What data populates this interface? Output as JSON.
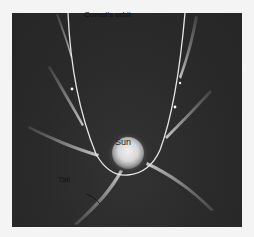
{
  "diagram": {
    "title": "Comet's orbit",
    "labels": {
      "orbit": "Comet's orbit",
      "sun": "Sun",
      "tail": "Tail"
    },
    "colors": {
      "background": "#2b2b2b",
      "orbit_line": "#e6e6e6",
      "tail": "#bdbdbd",
      "sun_core": "#e8e8e8",
      "sun_halo": "#8a8a8a",
      "label_text": "#121212",
      "page": "#f4f4f4"
    },
    "nodes": [
      {
        "id": "sun",
        "label": "Sun",
        "x": 128,
        "y": 153,
        "radius": 16
      },
      {
        "id": "orbit",
        "label": "Comet's orbit",
        "shape": "parabola opening upward around the Sun"
      },
      {
        "id": "tail",
        "label": "Tail",
        "note": "comet tails always point away from the Sun"
      }
    ],
    "comet_positions": [
      {
        "side": "left",
        "x": 70,
        "y": 58,
        "tail_direction": "up-left"
      },
      {
        "side": "left",
        "x": 74,
        "y": 89,
        "tail_direction": "up-left"
      },
      {
        "side": "left",
        "x": 81,
        "y": 126,
        "tail_direction": "left"
      },
      {
        "side": "left",
        "x": 96,
        "y": 157,
        "tail_direction": "left"
      },
      {
        "side": "bottom",
        "x": 120,
        "y": 170,
        "tail_direction": "down-left"
      },
      {
        "side": "bottom",
        "x": 148,
        "y": 163,
        "tail_direction": "down-right"
      },
      {
        "side": "right",
        "x": 163,
        "y": 139,
        "tail_direction": "right"
      },
      {
        "side": "right",
        "x": 176,
        "y": 107,
        "tail_direction": "up-right"
      },
      {
        "side": "right",
        "x": 182,
        "y": 75,
        "tail_direction": "up-right"
      }
    ]
  }
}
